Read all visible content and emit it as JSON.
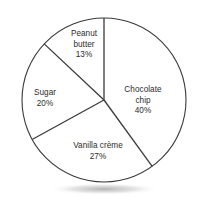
{
  "chart_data": {
    "type": "pie",
    "title": "",
    "subtitle": "",
    "xlabel": "",
    "ylabel": "",
    "legend_position": "none",
    "grid": false,
    "labels_inside_slices": true,
    "start_angle_deg": 0,
    "direction": "clockwise",
    "units": "percent",
    "total": 100,
    "categories": [
      "Chocolate chip",
      "Vanilla crème",
      "Sugar",
      "Peanut butter"
    ],
    "values": [
      40,
      27,
      20,
      13
    ],
    "slices": [
      {
        "name": "Chocolate chip",
        "name_line_1": "Chocolate",
        "name_line_2": "chip",
        "value": 40,
        "value_label": "40%",
        "start_angle_deg": 0,
        "end_angle_deg": 144,
        "sweep_deg": 144,
        "fill": "#ffffff",
        "stroke": "#3a3a3a"
      },
      {
        "name": "Vanilla crème",
        "name_line_1": "Vanilla crème",
        "name_line_2": "",
        "value": 27,
        "value_label": "27%",
        "start_angle_deg": 144,
        "end_angle_deg": 241.2,
        "sweep_deg": 97.2,
        "fill": "#ffffff",
        "stroke": "#3a3a3a"
      },
      {
        "name": "Sugar",
        "name_line_1": "Sugar",
        "name_line_2": "",
        "value": 20,
        "value_label": "20%",
        "start_angle_deg": 241.2,
        "end_angle_deg": 313.2,
        "sweep_deg": 72,
        "fill": "#ffffff",
        "stroke": "#3a3a3a"
      },
      {
        "name": "Peanut butter",
        "name_line_1": "Peanut",
        "name_line_2": "butter",
        "value": 13,
        "value_label": "13%",
        "start_angle_deg": 313.2,
        "end_angle_deg": 360,
        "sweep_deg": 46.8,
        "fill": "#ffffff",
        "stroke": "#3a3a3a"
      }
    ],
    "geometry": {
      "center_x": 104,
      "center_y": 100,
      "radius": 82
    },
    "colors": {
      "background": "#ffffff",
      "outline": "#3a3a3a",
      "divider": "#3a3a3a",
      "text": "#2b2b2b"
    }
  }
}
